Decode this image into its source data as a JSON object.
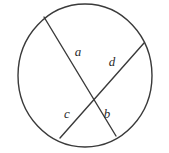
{
  "figure": {
    "name": "circle-with-two-intersecting-chords",
    "background_color": "#ffffff",
    "stroke_color": "#3a3a3a",
    "label_color": "#2b2b2b",
    "stroke_width": 1.4,
    "width": 169,
    "height": 153
  },
  "circle": {
    "center_x": 85,
    "center_y": 75.5,
    "radius_x": 67,
    "radius_y": 71.5
  },
  "intersection": {
    "x": 93,
    "y": 96
  },
  "chords": [
    {
      "id": "chord-1",
      "name": "chord-upper-left-to-lower-right",
      "x1": 44,
      "y1": 17,
      "x2": 116,
      "y2": 136
    },
    {
      "id": "chord-2",
      "name": "chord-upper-right-to-lower-left",
      "x1": 144,
      "y1": 43,
      "x2": 60,
      "y2": 138
    }
  ],
  "labels": [
    {
      "id": "label-a",
      "text": "a",
      "x": 78,
      "y": 51
    },
    {
      "id": "label-d",
      "text": "d",
      "x": 112,
      "y": 61
    },
    {
      "id": "label-c",
      "text": "c",
      "x": 67,
      "y": 113
    },
    {
      "id": "label-b",
      "text": "b",
      "x": 107,
      "y": 113
    }
  ],
  "chart_data": {
    "type": "diagram",
    "title": "",
    "segments": [
      {
        "label": "a",
        "chord": "chord-1",
        "position": "upper-left"
      },
      {
        "label": "d",
        "chord": "chord-2",
        "position": "upper-right"
      },
      {
        "label": "c",
        "chord": "chord-2",
        "position": "lower-left"
      },
      {
        "label": "b",
        "chord": "chord-1",
        "position": "lower-right"
      }
    ]
  }
}
